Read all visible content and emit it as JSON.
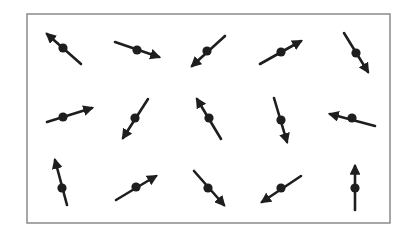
{
  "figure": {
    "frame": {
      "x": 27,
      "y": 14,
      "width": 363,
      "height": 209,
      "stroke": "#8a8a8a"
    },
    "arrow_color": "#1e1e1e",
    "rows": 3,
    "cols": 5,
    "arrows": [
      {
        "row": 1,
        "col": 1,
        "center": [
          63,
          48
        ],
        "tail": [
          81,
          64
        ],
        "head": [
          47,
          34
        ]
      },
      {
        "row": 1,
        "col": 2,
        "center": [
          137,
          50
        ],
        "tail": [
          115,
          42
        ],
        "head": [
          159,
          57
        ]
      },
      {
        "row": 1,
        "col": 3,
        "center": [
          207,
          51
        ],
        "tail": [
          225,
          36
        ],
        "head": [
          192,
          66
        ]
      },
      {
        "row": 1,
        "col": 4,
        "center": [
          281,
          52
        ],
        "tail": [
          260,
          64
        ],
        "head": [
          301,
          41
        ]
      },
      {
        "row": 1,
        "col": 5,
        "center": [
          356,
          53
        ],
        "tail": [
          344,
          33
        ],
        "head": [
          368,
          72
        ]
      },
      {
        "row": 2,
        "col": 1,
        "center": [
          63,
          117
        ],
        "tail": [
          47,
          122
        ],
        "head": [
          92,
          108
        ]
      },
      {
        "row": 2,
        "col": 2,
        "center": [
          135,
          118
        ],
        "tail": [
          148,
          99
        ],
        "head": [
          123,
          138
        ]
      },
      {
        "row": 2,
        "col": 3,
        "center": [
          209,
          118
        ],
        "tail": [
          221,
          139
        ],
        "head": [
          197,
          99
        ]
      },
      {
        "row": 2,
        "col": 4,
        "center": [
          281,
          120
        ],
        "tail": [
          274,
          98
        ],
        "head": [
          287,
          142
        ]
      },
      {
        "row": 2,
        "col": 5,
        "center": [
          352,
          118
        ],
        "tail": [
          375,
          126
        ],
        "head": [
          330,
          114
        ]
      },
      {
        "row": 3,
        "col": 1,
        "center": [
          62,
          188
        ],
        "tail": [
          67,
          205
        ],
        "head": [
          55,
          160
        ]
      },
      {
        "row": 3,
        "col": 2,
        "center": [
          136,
          187
        ],
        "tail": [
          116,
          200
        ],
        "head": [
          156,
          176
        ]
      },
      {
        "row": 3,
        "col": 3,
        "center": [
          208,
          188
        ],
        "tail": [
          194,
          171
        ],
        "head": [
          224,
          205
        ]
      },
      {
        "row": 3,
        "col": 4,
        "center": [
          281,
          188
        ],
        "tail": [
          301,
          176
        ],
        "head": [
          262,
          202
        ]
      },
      {
        "row": 3,
        "col": 5,
        "center": [
          355,
          188
        ],
        "tail": [
          355,
          210
        ],
        "head": [
          355,
          166
        ]
      }
    ]
  }
}
